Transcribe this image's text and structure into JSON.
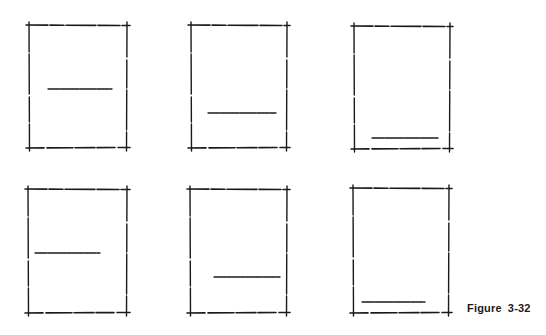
{
  "figure": {
    "label": "Figure",
    "number": "3-32",
    "stroke_color": "#1a1a1a",
    "background": "#ffffff"
  },
  "frames": [
    {
      "id": "frame-1",
      "row": 1,
      "col": 1,
      "x1": 29,
      "y1": 25,
      "x2": 127,
      "y2": 148,
      "line": {
        "x1": 48,
        "x2": 112,
        "y": 89
      },
      "line_position": "middle-center"
    },
    {
      "id": "frame-2",
      "row": 1,
      "col": 2,
      "x1": 191,
      "y1": 25,
      "x2": 287,
      "y2": 148,
      "line": {
        "x1": 208,
        "x2": 276,
        "y": 113
      },
      "line_position": "lower-center"
    },
    {
      "id": "frame-3",
      "row": 1,
      "col": 3,
      "x1": 354,
      "y1": 26,
      "x2": 450,
      "y2": 149,
      "line": {
        "x1": 372,
        "x2": 438,
        "y": 138
      },
      "line_position": "bottom-center"
    },
    {
      "id": "frame-4",
      "row": 2,
      "col": 1,
      "x1": 28,
      "y1": 189,
      "x2": 127,
      "y2": 313,
      "line": {
        "x1": 35,
        "x2": 100,
        "y": 253
      },
      "line_position": "middle-left"
    },
    {
      "id": "frame-5",
      "row": 2,
      "col": 2,
      "x1": 190,
      "y1": 189,
      "x2": 287,
      "y2": 313,
      "line": {
        "x1": 214,
        "x2": 280,
        "y": 277
      },
      "line_position": "lower-right"
    },
    {
      "id": "frame-6",
      "row": 2,
      "col": 3,
      "x1": 353,
      "y1": 188,
      "x2": 449,
      "y2": 313,
      "line": {
        "x1": 362,
        "x2": 425,
        "y": 302
      },
      "line_position": "bottom-left"
    }
  ]
}
